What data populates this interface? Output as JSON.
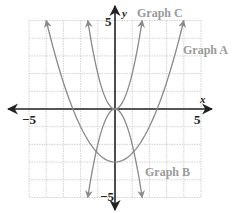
{
  "chart_data": {
    "type": "line",
    "title": "",
    "xlabel": "x",
    "ylabel": "y",
    "xlim": [
      -5,
      5
    ],
    "ylim": [
      -5,
      5
    ],
    "grid": true,
    "tick_labels": {
      "x_min": "−5",
      "x_max": "5",
      "y_max": "5",
      "y_min": "−5"
    },
    "series": [
      {
        "name": "Graph A",
        "equation": "y = 0.5x^2 - 3",
        "a": 0.5,
        "k": -3,
        "x": [
          -4,
          -3,
          -2,
          -1,
          0,
          1,
          2,
          3,
          4
        ],
        "y": [
          5,
          1.5,
          -1,
          -2.5,
          -3,
          -2.5,
          -1,
          1.5,
          5
        ]
      },
      {
        "name": "Graph B",
        "equation": "y = -2x^2",
        "a": -2,
        "k": 0,
        "x": [
          -1.58,
          -1,
          0,
          1,
          1.58
        ],
        "y": [
          -5,
          -2,
          0,
          -2,
          -5
        ]
      },
      {
        "name": "Graph C",
        "equation": "y = 2x^2",
        "a": 2,
        "k": 0,
        "x": [
          -1.58,
          -1,
          0,
          1,
          1.58
        ],
        "y": [
          5,
          2,
          0,
          2,
          5
        ]
      }
    ],
    "legend": "inline labels"
  },
  "labels": {
    "graph_a": "Graph A",
    "graph_b": "Graph B",
    "graph_c": "Graph C",
    "x_axis": "x",
    "y_axis": "y",
    "x_min": "−5",
    "x_max": "5",
    "y_max": "5",
    "y_min": "−5"
  },
  "colors": {
    "axis": "#222222",
    "curve": "#8a8a8a",
    "grid": "#c8c8c8",
    "label": "#9a9a9a"
  }
}
